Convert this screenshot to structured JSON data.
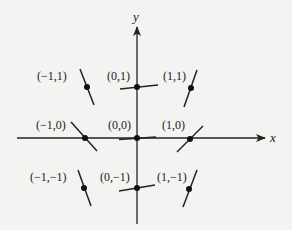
{
  "figure": {
    "type": "slope-field",
    "background": "#f3f3f1",
    "ink": "#222222",
    "axes": {
      "x_label": "x",
      "y_label": "y"
    },
    "points": [
      {
        "label": "(−1,1)",
        "slope_desc": "steep negative"
      },
      {
        "label": "(0,1)",
        "slope_desc": "slight positive"
      },
      {
        "label": "(1,1)",
        "slope_desc": "steep positive"
      },
      {
        "label": "(−1,0)",
        "slope_desc": "negative (~ -1)"
      },
      {
        "label": "(0,0)",
        "slope_desc": "near zero"
      },
      {
        "label": "(1,0)",
        "slope_desc": "positive (~ 1)"
      },
      {
        "label": "(−1,−1)",
        "slope_desc": "steep negative"
      },
      {
        "label": "(0,−1)",
        "slope_desc": "slight positive"
      },
      {
        "label": "(1,−1)",
        "slope_desc": "steep positive"
      }
    ]
  }
}
